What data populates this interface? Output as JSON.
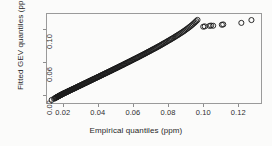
{
  "chart_data": {
    "type": "scatter",
    "title": "",
    "xlabel": "Empirical quantiles (ppm)",
    "ylabel": "Fitted GEV quantiles (ppm)",
    "xlim": [
      0.0105,
      0.1335
    ],
    "ylim": [
      0.0095,
      0.1195
    ],
    "xticks": [
      0.02,
      0.04,
      0.06,
      0.08,
      0.1,
      0.12
    ],
    "xtick_labels": [
      "0.02",
      "0.04",
      "0.06",
      "0.08",
      "0.10",
      "0.12"
    ],
    "yticks": [
      0.02,
      0.06,
      0.1
    ],
    "ytick_labels": [
      "0.02",
      "0.06",
      "0.10"
    ],
    "grid": false,
    "legend": null,
    "marker": "open-circle",
    "marker_color": "#1c1c1c",
    "marker_size": 2.6,
    "series": [
      {
        "name": "GEV Q-Q points",
        "x": [
          0.0132,
          0.0146,
          0.0151,
          0.0155,
          0.0158,
          0.0161,
          0.0164,
          0.0166,
          0.0169,
          0.0171,
          0.0174,
          0.0176,
          0.0179,
          0.0181,
          0.0184,
          0.0186,
          0.0189,
          0.0191,
          0.0194,
          0.0196,
          0.0199,
          0.0202,
          0.0205,
          0.0208,
          0.0211,
          0.0214,
          0.0217,
          0.022,
          0.0223,
          0.0226,
          0.0229,
          0.0232,
          0.0236,
          0.0239,
          0.0242,
          0.0246,
          0.0249,
          0.0253,
          0.0256,
          0.026,
          0.0263,
          0.0267,
          0.027,
          0.0274,
          0.0278,
          0.0281,
          0.0285,
          0.0289,
          0.0292,
          0.0296,
          0.03,
          0.0304,
          0.0308,
          0.0311,
          0.0315,
          0.0319,
          0.0323,
          0.0327,
          0.0331,
          0.0335,
          0.0339,
          0.0343,
          0.0347,
          0.0351,
          0.0355,
          0.0359,
          0.0363,
          0.0367,
          0.0371,
          0.0375,
          0.0379,
          0.0384,
          0.0388,
          0.0392,
          0.0396,
          0.04,
          0.0405,
          0.0409,
          0.0413,
          0.0417,
          0.0422,
          0.0426,
          0.043,
          0.0435,
          0.0439,
          0.0443,
          0.0448,
          0.0452,
          0.0457,
          0.0461,
          0.0466,
          0.047,
          0.0475,
          0.0479,
          0.0484,
          0.0488,
          0.0493,
          0.0497,
          0.0502,
          0.0507,
          0.0511,
          0.0516,
          0.0521,
          0.0525,
          0.053,
          0.0535,
          0.054,
          0.0545,
          0.0549,
          0.0554,
          0.0559,
          0.0564,
          0.0569,
          0.0574,
          0.0579,
          0.0584,
          0.0589,
          0.0594,
          0.0599,
          0.0604,
          0.0609,
          0.0615,
          0.062,
          0.0625,
          0.063,
          0.0636,
          0.0641,
          0.0646,
          0.0652,
          0.0657,
          0.0663,
          0.0668,
          0.0674,
          0.0679,
          0.0685,
          0.069,
          0.0696,
          0.0702,
          0.0707,
          0.0713,
          0.0719,
          0.0725,
          0.0731,
          0.0737,
          0.0743,
          0.0749,
          0.0755,
          0.0761,
          0.0767,
          0.0773,
          0.0779,
          0.0786,
          0.0792,
          0.0798,
          0.0805,
          0.0811,
          0.0818,
          0.0824,
          0.0831,
          0.0838,
          0.0844,
          0.0851,
          0.0858,
          0.0865,
          0.0872,
          0.0879,
          0.0886,
          0.0893,
          0.09,
          0.0907,
          0.0914,
          0.0921,
          0.0928,
          0.0935,
          0.0942,
          0.0949,
          0.0956,
          0.0963,
          0.097,
          0.1003,
          0.1012,
          0.1039,
          0.1048,
          0.106,
          0.111,
          0.1118,
          0.1222,
          0.128
        ],
        "y": [
          0.0133,
          0.0148,
          0.0154,
          0.0159,
          0.0163,
          0.0167,
          0.017,
          0.0173,
          0.0176,
          0.0179,
          0.0182,
          0.0185,
          0.0188,
          0.0191,
          0.0194,
          0.0196,
          0.0199,
          0.0202,
          0.0205,
          0.0208,
          0.0211,
          0.0214,
          0.0217,
          0.022,
          0.0223,
          0.0226,
          0.0229,
          0.0232,
          0.0236,
          0.0239,
          0.0242,
          0.0245,
          0.0249,
          0.0252,
          0.0256,
          0.0259,
          0.0263,
          0.0266,
          0.027,
          0.0273,
          0.0277,
          0.0281,
          0.0284,
          0.0288,
          0.0292,
          0.0296,
          0.03,
          0.0303,
          0.0307,
          0.0311,
          0.0315,
          0.0319,
          0.0323,
          0.0327,
          0.0331,
          0.0335,
          0.0339,
          0.0343,
          0.0347,
          0.0351,
          0.0355,
          0.036,
          0.0364,
          0.0368,
          0.0372,
          0.0376,
          0.038,
          0.0385,
          0.0389,
          0.0393,
          0.0397,
          0.0402,
          0.0406,
          0.041,
          0.0415,
          0.0419,
          0.0423,
          0.0428,
          0.0432,
          0.0437,
          0.0441,
          0.0446,
          0.045,
          0.0455,
          0.0459,
          0.0464,
          0.0468,
          0.0473,
          0.0478,
          0.0482,
          0.0487,
          0.0492,
          0.0496,
          0.0501,
          0.0506,
          0.0511,
          0.0516,
          0.052,
          0.0525,
          0.053,
          0.0535,
          0.054,
          0.0545,
          0.055,
          0.0555,
          0.056,
          0.0565,
          0.057,
          0.0576,
          0.0581,
          0.0586,
          0.0591,
          0.0597,
          0.0602,
          0.0607,
          0.0613,
          0.0618,
          0.0624,
          0.0629,
          0.0635,
          0.064,
          0.0646,
          0.0652,
          0.0657,
          0.0663,
          0.0669,
          0.0675,
          0.0681,
          0.0687,
          0.0693,
          0.0699,
          0.0705,
          0.0711,
          0.0718,
          0.0724,
          0.073,
          0.0737,
          0.0743,
          0.075,
          0.0757,
          0.0763,
          0.077,
          0.0777,
          0.0784,
          0.0791,
          0.0798,
          0.0805,
          0.0813,
          0.082,
          0.0828,
          0.0835,
          0.0843,
          0.0851,
          0.0859,
          0.0867,
          0.0875,
          0.0883,
          0.0892,
          0.09,
          0.0909,
          0.0918,
          0.0927,
          0.0936,
          0.0946,
          0.0955,
          0.0965,
          0.0975,
          0.0985,
          0.0996,
          0.1007,
          0.1018,
          0.1029,
          0.1041,
          0.1053,
          0.1066,
          0.1079,
          0.1093,
          0.1107,
          0.1122,
          0.1038,
          0.1042,
          0.1048,
          0.1052,
          0.105,
          0.1062,
          0.1066,
          0.1085,
          0.112
        ],
        "marker": "open-circle"
      }
    ]
  },
  "axes": {
    "x_label": "Empirical quantiles (ppm)",
    "y_label": "Fitted GEV quantiles (ppm)",
    "x_tick_labels": [
      "0.02",
      "0.04",
      "0.06",
      "0.08",
      "0.10",
      "0.12"
    ],
    "y_tick_labels": [
      "0.02",
      "0.06",
      "0.10"
    ],
    "frame_color": "#9a9a9a",
    "text_color": "#272727"
  }
}
